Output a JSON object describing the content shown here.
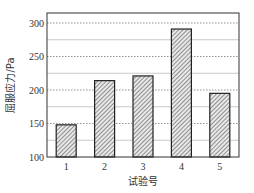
{
  "chart_data": {
    "type": "bar",
    "title": "",
    "xlabel": "试验号",
    "ylabel": "屈服应力/Pa",
    "categories": [
      "1",
      "2",
      "3",
      "4",
      "5"
    ],
    "values": [
      148,
      214,
      221,
      291,
      195
    ],
    "ylim": [
      100,
      310
    ],
    "yticks": [
      100,
      150,
      200,
      250,
      300
    ],
    "grid": {
      "major": [
        150,
        200,
        250,
        300
      ],
      "minor": [
        125,
        175,
        225,
        275
      ],
      "major_style": "dotted",
      "minor_style": "solid"
    },
    "legend": null,
    "bar_style": {
      "fill": "diagonal-hatch",
      "edge_color": "#222222",
      "hatch_color": "#555555"
    }
  }
}
